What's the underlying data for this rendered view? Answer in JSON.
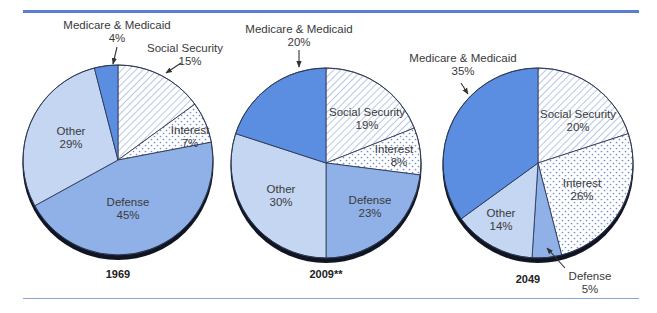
{
  "colors": {
    "medicare": "#5b8ee0",
    "defense": "#8fb1e8",
    "other": "#c4d6f2",
    "pattern": "#6e8fce",
    "outline": "#2a3550",
    "shadow": "#111522",
    "rule": "#5b7fd0"
  },
  "chart_data": [
    {
      "type": "pie",
      "title": "1969",
      "categories": [
        "Social Security",
        "Interest",
        "Defense",
        "Other",
        "Medicare & Medicaid"
      ],
      "values": [
        15,
        7,
        45,
        29,
        4
      ],
      "start_angle": "12 o'clock, clockwise"
    },
    {
      "type": "pie",
      "title": "2009**",
      "categories": [
        "Social Security",
        "Interest",
        "Defense",
        "Other",
        "Medicare & Medicaid"
      ],
      "values": [
        19,
        8,
        23,
        30,
        20
      ],
      "start_angle": "12 o'clock, clockwise"
    },
    {
      "type": "pie",
      "title": "2049",
      "categories": [
        "Social Security",
        "Interest",
        "Defense",
        "Other",
        "Medicare & Medicaid"
      ],
      "values": [
        20,
        26,
        5,
        14,
        35
      ],
      "start_angle": "12 o'clock, clockwise"
    }
  ],
  "pies": [
    {
      "year": "1969",
      "cx": 118,
      "cy": 160,
      "r": 95,
      "year_pos": [
        118,
        278
      ],
      "slices": [
        {
          "key": "ss",
          "name": "Social Security",
          "value": 15,
          "fill": "hatch"
        },
        {
          "key": "int",
          "name": "Interest",
          "value": 7,
          "fill": "dots"
        },
        {
          "key": "def",
          "name": "Defense",
          "value": 45,
          "fill": "defense"
        },
        {
          "key": "oth",
          "name": "Other",
          "value": 29,
          "fill": "other"
        },
        {
          "key": "med",
          "name": "Medicare & Medicaid",
          "value": 4,
          "fill": "medicare"
        }
      ],
      "labels": [
        {
          "text": "Medicare & Medicaid",
          "pct": "4%",
          "x": 117,
          "y": 29,
          "anchor": "middle",
          "arrow": [
            117,
            47,
            113,
            64
          ]
        },
        {
          "text": "Social Security",
          "pct": "15%",
          "x": 185,
          "y": 52,
          "anchor": "middle",
          "pct_x": 190,
          "arrow": [
            181,
            63,
            166,
            73
          ]
        },
        {
          "text": "Interest",
          "pct": "7%",
          "x": 190,
          "y": 134,
          "anchor": "middle"
        },
        {
          "text": "Other",
          "pct": "29%",
          "x": 71,
          "y": 135,
          "anchor": "middle"
        },
        {
          "text": "Defense",
          "pct": "45%",
          "x": 128,
          "y": 206,
          "anchor": "middle"
        }
      ]
    },
    {
      "year": "2009**",
      "cx": 326,
      "cy": 163,
      "r": 95,
      "year_pos": [
        326,
        278
      ],
      "slices": [
        {
          "key": "ss",
          "name": "Social Security",
          "value": 19,
          "fill": "hatch"
        },
        {
          "key": "int",
          "name": "Interest",
          "value": 8,
          "fill": "dots"
        },
        {
          "key": "def",
          "name": "Defense",
          "value": 23,
          "fill": "defense"
        },
        {
          "key": "oth",
          "name": "Other",
          "value": 30,
          "fill": "other"
        },
        {
          "key": "med",
          "name": "Medicare & Medicaid",
          "value": 20,
          "fill": "medicare"
        }
      ],
      "labels": [
        {
          "text": "Medicare & Medicaid",
          "pct": "20%",
          "x": 299,
          "y": 33,
          "anchor": "middle",
          "arrow": [
            299,
            50,
            299,
            67
          ]
        },
        {
          "text": "Social Security",
          "pct": "19%",
          "x": 367,
          "y": 116,
          "anchor": "middle"
        },
        {
          "text": "Interest",
          "pct": "8%",
          "x": 394,
          "y": 153,
          "anchor": "middle",
          "pct_x": 399
        },
        {
          "text": "Other",
          "pct": "30%",
          "x": 281,
          "y": 193,
          "anchor": "middle"
        },
        {
          "text": "Defense",
          "pct": "23%",
          "x": 370,
          "y": 204,
          "anchor": "middle"
        }
      ]
    },
    {
      "year": "2049",
      "cx": 538,
      "cy": 163,
      "r": 95,
      "year_pos": [
        528,
        283
      ],
      "slices": [
        {
          "key": "ss",
          "name": "Social Security",
          "value": 20,
          "fill": "hatch"
        },
        {
          "key": "int",
          "name": "Interest",
          "value": 26,
          "fill": "dots"
        },
        {
          "key": "def",
          "name": "Defense",
          "value": 5,
          "fill": "defense"
        },
        {
          "key": "oth",
          "name": "Other",
          "value": 14,
          "fill": "other"
        },
        {
          "key": "med",
          "name": "Medicare & Medicaid",
          "value": 35,
          "fill": "medicare"
        }
      ],
      "labels": [
        {
          "text": "Medicare & Medicaid",
          "pct": "35%",
          "x": 463,
          "y": 62,
          "anchor": "middle",
          "arrow": [
            461,
            83,
            468,
            94
          ]
        },
        {
          "text": "Social Security",
          "pct": "20%",
          "x": 578,
          "y": 118,
          "anchor": "middle"
        },
        {
          "text": "Interest",
          "pct": "26%",
          "x": 582,
          "y": 187,
          "anchor": "middle"
        },
        {
          "text": "Other",
          "pct": "14%",
          "x": 501,
          "y": 217,
          "anchor": "middle"
        },
        {
          "text": "Defense",
          "pct": "5%",
          "x": 590,
          "y": 280,
          "anchor": "middle",
          "arrow": [
            565,
            268,
            547,
            248
          ]
        }
      ]
    }
  ]
}
